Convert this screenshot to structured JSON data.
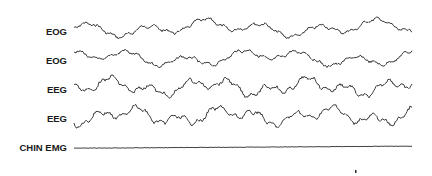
{
  "figure": {
    "type": "polysomnography-recording",
    "channels": [
      {
        "label": "EOG",
        "baseline_y": 28,
        "amplitude": 9,
        "style": "slow"
      },
      {
        "label": "EOG",
        "baseline_y": 58,
        "amplitude": 9,
        "style": "slow"
      },
      {
        "label": "EEG",
        "baseline_y": 87,
        "amplitude": 11,
        "style": "fast"
      },
      {
        "label": "EEG",
        "baseline_y": 116,
        "amplitude": 11,
        "style": "fast"
      },
      {
        "label": "CHIN EMG",
        "baseline_y": 147,
        "amplitude": 0.4,
        "style": "flat"
      }
    ],
    "trace_x_start": 74,
    "trace_x_end": 412,
    "marker": {
      "x": 355,
      "y": 172
    }
  },
  "colors": {
    "trace": "#2a2a2a",
    "label": "#1a1a1a",
    "background": "#ffffff"
  }
}
